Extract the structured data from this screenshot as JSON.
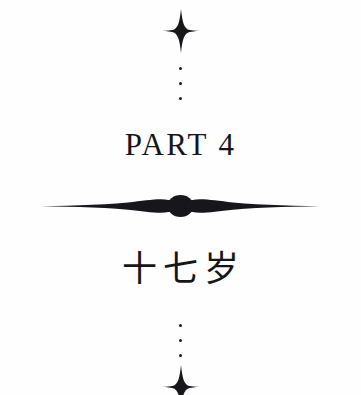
{
  "page": {
    "background_color": "#fefefe",
    "ink_color": "#17161a",
    "kind": "book-part-title-page"
  },
  "ornaments": {
    "star_top": {
      "icon": "four-pointed-star-icon",
      "points": 4,
      "color": "#17161a"
    },
    "star_bottom": {
      "icon": "four-pointed-star-icon",
      "points": 4,
      "color": "#17161a",
      "clipped_at_page_edge": true
    },
    "dots_top": {
      "icon": "vertical-three-dots-icon",
      "count": 3,
      "color": "#1c1b20"
    },
    "dots_bottom": {
      "icon": "vertical-three-dots-icon",
      "count": 3,
      "color": "#1c1b20"
    },
    "divider": {
      "icon": "leaf-lens-divider-icon",
      "description": "two tapering lens leaves flanking a central dot",
      "color": "#17161a"
    }
  },
  "content": {
    "part_label": "PART 4",
    "part_number": "4",
    "chapter_title_zh": "十七岁"
  }
}
